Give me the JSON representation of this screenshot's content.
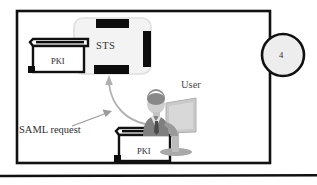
{
  "diagram": {
    "type": "architecture-flow",
    "step_badge": {
      "name": "step-number-badge",
      "value": "4",
      "fill": "#ededed",
      "stroke": "#111111"
    },
    "frame": {
      "name": "outer-boundary",
      "stroke": "#111111"
    },
    "baseline_rule": {
      "name": "bottom-rule",
      "stroke": "#111111"
    },
    "nodes": [
      {
        "id": "sts",
        "name": "sts-server-node",
        "label": "STS",
        "body_fill": "#f1f1f1",
        "body_stroke": "#dcdcdc",
        "bar_fill": "#0d0d0d"
      },
      {
        "id": "pki-top",
        "name": "pki-card-reader-top",
        "label": "PKI",
        "fill": "#ffffff",
        "stroke": "#111111"
      },
      {
        "id": "pki-bottom",
        "name": "pki-card-reader-bottom",
        "label": "PKI",
        "fill": "#ffffff",
        "stroke": "#111111"
      },
      {
        "id": "user",
        "name": "user-at-workstation",
        "label": "User",
        "fill": "#b5b5b5"
      }
    ],
    "connectors": [
      {
        "id": "saml-arrow",
        "name": "saml-request-arrow",
        "label": "SAML request",
        "stroke": "#8c8c8c",
        "from": "saml-request-label",
        "to": "user-workstation"
      },
      {
        "id": "user-to-sts",
        "name": "user-to-sts-arrow",
        "stroke": "#a8a8a8",
        "from": "user-at-workstation",
        "to": "sts-server-node"
      }
    ]
  }
}
